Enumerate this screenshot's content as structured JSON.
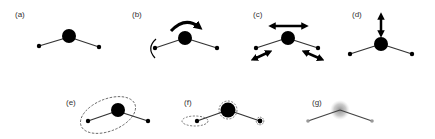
{
  "figure": {
    "panels": [
      {
        "id": "a",
        "label": "(a)",
        "description": "bent triatomic molecule"
      },
      {
        "id": "b",
        "label": "(b)",
        "description": "rotation arrows"
      },
      {
        "id": "c",
        "label": "(c)",
        "description": "stretching / translation double arrows"
      },
      {
        "id": "d",
        "label": "(d)",
        "description": "vertical displacement arrow"
      },
      {
        "id": "e",
        "label": "(e)",
        "description": "dashed ellipse enclosing bond group"
      },
      {
        "id": "f",
        "label": "(f)",
        "description": "dashed outlines around atoms"
      },
      {
        "id": "g",
        "label": "(g)",
        "description": "blurred central atom"
      }
    ],
    "colors": {
      "atom": "#000000",
      "bond": "#333333",
      "dashed": "#555555",
      "blur": "#9a9a9a",
      "label": "#333333"
    }
  }
}
